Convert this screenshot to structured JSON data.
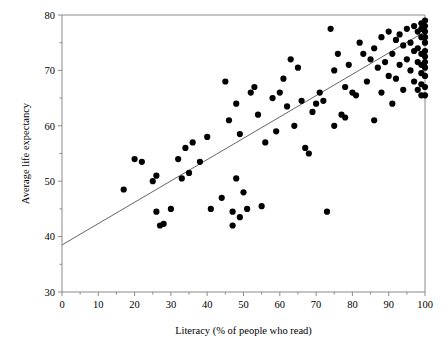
{
  "chart_data": {
    "type": "scatter",
    "title": "",
    "xlabel": "Literacy (% of people who read)",
    "ylabel": "Average life expectancy",
    "xlim": [
      0,
      100
    ],
    "ylim": [
      30,
      80
    ],
    "xticks": [
      0,
      10,
      20,
      30,
      40,
      50,
      60,
      70,
      80,
      90,
      100
    ],
    "xtick_labels": [
      "0",
      "10",
      "20",
      "30",
      "40",
      "50",
      "60",
      "70",
      "80",
      "90",
      "100"
    ],
    "x_minor_tick_step": 5,
    "yticks": [
      30,
      40,
      50,
      60,
      70,
      80
    ],
    "ytick_labels": [
      "30",
      "40",
      "50",
      "60",
      "70",
      "80"
    ],
    "y_minor_tick_step": 5,
    "grid": false,
    "legend": null,
    "marker": {
      "shape": "circle",
      "color": "#000000",
      "size": 3.1
    },
    "trendline": {
      "type": "linear",
      "color": "#555555",
      "width": 0.9,
      "x_start": 0,
      "y_start": 38.5,
      "x_end": 100,
      "y_end": 77.0
    },
    "points": [
      [
        17,
        48.5
      ],
      [
        20,
        54.0
      ],
      [
        22,
        53.5
      ],
      [
        25,
        50.0
      ],
      [
        26,
        51.0
      ],
      [
        26,
        44.5
      ],
      [
        27,
        42.0
      ],
      [
        28,
        42.3
      ],
      [
        30,
        45.0
      ],
      [
        32,
        54.0
      ],
      [
        33,
        50.5
      ],
      [
        34,
        56.0
      ],
      [
        35,
        51.5
      ],
      [
        36,
        57.0
      ],
      [
        38,
        53.5
      ],
      [
        40,
        58.0
      ],
      [
        41,
        45.0
      ],
      [
        44,
        47.0
      ],
      [
        45,
        68.0
      ],
      [
        46,
        61.0
      ],
      [
        47,
        44.5
      ],
      [
        47,
        42.0
      ],
      [
        48,
        64.0
      ],
      [
        48,
        50.5
      ],
      [
        49,
        43.5
      ],
      [
        49,
        58.5
      ],
      [
        50,
        48.0
      ],
      [
        51,
        45.0
      ],
      [
        52,
        66.0
      ],
      [
        53,
        67.0
      ],
      [
        54,
        62.0
      ],
      [
        55,
        45.5
      ],
      [
        56,
        57.0
      ],
      [
        58,
        65.0
      ],
      [
        59,
        59.0
      ],
      [
        60,
        66.0
      ],
      [
        61,
        68.5
      ],
      [
        62,
        63.5
      ],
      [
        63,
        72.0
      ],
      [
        64,
        60.0
      ],
      [
        65,
        70.5
      ],
      [
        66,
        64.5
      ],
      [
        67,
        56.0
      ],
      [
        68,
        55.0
      ],
      [
        69,
        62.5
      ],
      [
        70,
        64.0
      ],
      [
        71,
        66.0
      ],
      [
        72,
        64.5
      ],
      [
        73,
        44.5
      ],
      [
        74,
        77.5
      ],
      [
        75,
        60.0
      ],
      [
        75,
        70.0
      ],
      [
        76,
        73.0
      ],
      [
        77,
        62.0
      ],
      [
        78,
        61.5
      ],
      [
        78,
        67.0
      ],
      [
        79,
        71.0
      ],
      [
        80,
        66.0
      ],
      [
        81,
        65.5
      ],
      [
        82,
        75.0
      ],
      [
        83,
        73.0
      ],
      [
        84,
        68.0
      ],
      [
        85,
        72.0
      ],
      [
        86,
        74.0
      ],
      [
        86,
        61.0
      ],
      [
        87,
        70.5
      ],
      [
        88,
        76.0
      ],
      [
        88,
        66.0
      ],
      [
        89,
        71.5
      ],
      [
        90,
        69.0
      ],
      [
        90,
        77.0
      ],
      [
        91,
        73.0
      ],
      [
        91,
        64.0
      ],
      [
        92,
        75.5
      ],
      [
        92,
        68.5
      ],
      [
        93,
        76.5
      ],
      [
        93,
        71.0
      ],
      [
        94,
        74.5
      ],
      [
        94,
        66.5
      ],
      [
        95,
        77.5
      ],
      [
        95,
        72.0
      ],
      [
        96,
        70.0
      ],
      [
        96,
        75.0
      ],
      [
        97,
        78.0
      ],
      [
        97,
        73.5
      ],
      [
        97,
        68.0
      ],
      [
        98,
        77.0
      ],
      [
        98,
        74.0
      ],
      [
        98,
        71.5
      ],
      [
        98,
        66.5
      ],
      [
        99,
        78.5
      ],
      [
        99,
        77.5
      ],
      [
        99,
        76.0
      ],
      [
        99,
        73.0
      ],
      [
        99,
        71.0
      ],
      [
        99,
        69.5
      ],
      [
        99,
        67.5
      ],
      [
        99,
        65.5
      ],
      [
        100,
        79.0
      ],
      [
        100,
        78.0
      ],
      [
        100,
        77.0
      ],
      [
        100,
        76.0
      ],
      [
        100,
        75.0
      ],
      [
        100,
        73.5
      ],
      [
        100,
        72.5
      ],
      [
        100,
        71.5
      ],
      [
        100,
        70.5
      ],
      [
        100,
        69.0
      ],
      [
        100,
        67.0
      ],
      [
        100,
        65.5
      ]
    ]
  },
  "axes": {
    "x_axis_label": "Literacy (% of people who read)",
    "y_axis_label": "Average life expectancy"
  }
}
